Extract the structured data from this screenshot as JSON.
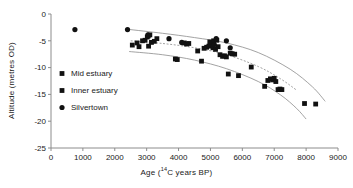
{
  "chart_data": {
    "type": "scatter",
    "title": "",
    "xlabel": "Age (14C years BP)",
    "xlabel_prefix": "Age (",
    "xlabel_sup": "14",
    "xlabel_suffix": "C years BP)",
    "ylabel": "Altitude (metres OD)",
    "xlim": [
      0,
      9000
    ],
    "ylim": [
      -25,
      0
    ],
    "xticks": [
      0,
      1000,
      2000,
      3000,
      4000,
      5000,
      6000,
      7000,
      8000,
      9000
    ],
    "xtick_labels": [
      "0",
      "1000",
      "2000",
      "3000",
      "4000",
      "5000",
      "6000",
      "7000",
      "8000",
      "9000"
    ],
    "yticks": [
      0,
      -5,
      -10,
      -15,
      -20,
      -25
    ],
    "ytick_labels": [
      "0",
      "-5",
      "-10",
      "-15",
      "-20",
      "-25"
    ],
    "grid": false,
    "legend_position": "inside-left",
    "colors": {
      "marker": "#111111",
      "axis": "#8c8c8c",
      "curve": "#8c8c8c",
      "text": "#1a1a1a"
    },
    "series": [
      {
        "name": "Mid estuary",
        "marker": "square",
        "color": "#111111",
        "points": [
          [
            2550,
            -5.8
          ],
          [
            2700,
            -5.4
          ],
          [
            2760,
            -6.1
          ],
          [
            2870,
            -5.0
          ],
          [
            2950,
            -4.9
          ],
          [
            3020,
            -4.3
          ],
          [
            3060,
            -6.0
          ],
          [
            3150,
            -5.3
          ],
          [
            3240,
            -5.1
          ],
          [
            3320,
            -4.6
          ],
          [
            3900,
            -8.4
          ],
          [
            3960,
            -8.5
          ],
          [
            4180,
            -5.4
          ],
          [
            4250,
            -5.6
          ],
          [
            4320,
            -5.5
          ],
          [
            4600,
            -6.9
          ],
          [
            4720,
            -8.8
          ],
          [
            4800,
            -6.4
          ],
          [
            4880,
            -6.2
          ],
          [
            4950,
            -6.0
          ],
          [
            5020,
            -5.6
          ],
          [
            5080,
            -6.3
          ],
          [
            5160,
            -6.6
          ],
          [
            5240,
            -6.1
          ],
          [
            5300,
            -7.6
          ],
          [
            5380,
            -7.9
          ],
          [
            5440,
            -7.8
          ],
          [
            5500,
            -8.0
          ],
          [
            5560,
            -11.2
          ],
          [
            5620,
            -7.3
          ],
          [
            5680,
            -7.4
          ],
          [
            5760,
            -7.5
          ],
          [
            5880,
            -11.5
          ],
          [
            6280,
            -9.9
          ],
          [
            6700,
            -13.5
          ],
          [
            6800,
            -12.4
          ],
          [
            6880,
            -12.1
          ],
          [
            6950,
            -12.3
          ],
          [
            7000,
            -12.0
          ],
          [
            7050,
            -12.6
          ],
          [
            7120,
            -14.1
          ],
          [
            7180,
            -14.0
          ],
          [
            7240,
            -14.1
          ],
          [
            7950,
            -16.7
          ],
          [
            8300,
            -16.8
          ]
        ]
      },
      {
        "name": "Inner estuary",
        "marker": "square",
        "color": "#111111",
        "points": [
          [
            3050,
            -4.1
          ],
          [
            3100,
            -3.9
          ],
          [
            4980,
            -5.2
          ],
          [
            5100,
            -5.0
          ],
          [
            5200,
            -4.9
          ]
        ]
      },
      {
        "name": "Silvertown",
        "marker": "circle",
        "color": "#111111",
        "points": [
          [
            750,
            -2.9
          ],
          [
            2400,
            -2.9
          ],
          [
            3040,
            -3.9
          ],
          [
            3700,
            -4.6
          ],
          [
            4100,
            -5.3
          ],
          [
            5120,
            -5.7
          ],
          [
            5180,
            -4.6
          ],
          [
            5500,
            -5.0
          ],
          [
            5620,
            -6.3
          ]
        ]
      }
    ],
    "envelope_curves": [
      {
        "name": "upper-bound-curve",
        "style": "solid",
        "points": [
          [
            2400,
            -2.85
          ],
          [
            3500,
            -3.6
          ],
          [
            4500,
            -4.4
          ],
          [
            5500,
            -5.4
          ],
          [
            6500,
            -7.2
          ],
          [
            7500,
            -10.3
          ],
          [
            8200,
            -13.6
          ],
          [
            8600,
            -16.3
          ]
        ]
      },
      {
        "name": "mean-curve",
        "style": "dashed",
        "points": [
          [
            2500,
            -5.0
          ],
          [
            3500,
            -5.5
          ],
          [
            4500,
            -6.3
          ],
          [
            5500,
            -7.6
          ],
          [
            6500,
            -9.8
          ],
          [
            7200,
            -12.1
          ],
          [
            7700,
            -14.2
          ]
        ]
      },
      {
        "name": "lower-bound-curve",
        "style": "solid",
        "points": [
          [
            2450,
            -7.0
          ],
          [
            3500,
            -7.6
          ],
          [
            4500,
            -8.6
          ],
          [
            5500,
            -10.2
          ],
          [
            6500,
            -12.6
          ],
          [
            7200,
            -15.1
          ],
          [
            7700,
            -17.6
          ],
          [
            8000,
            -19.6
          ]
        ]
      }
    ]
  },
  "legend": {
    "items": [
      {
        "label": "Mid estuary",
        "marker": "square"
      },
      {
        "label": "Inner estuary",
        "marker": "square"
      },
      {
        "label": "Silvertown",
        "marker": "circle"
      }
    ]
  }
}
